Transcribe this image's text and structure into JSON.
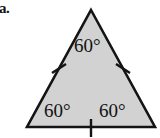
{
  "figure": {
    "item_label": "a.",
    "shape_name": "equilateral-triangle",
    "fill_color": "#d2d2d2",
    "stroke_color": "#141414",
    "background_color": "#ffffff",
    "angles": {
      "top": "60°",
      "bottom_left": "60°",
      "bottom_right": "60°"
    },
    "tick_marks": {
      "count": 3,
      "description": "single tick on each of the three sides"
    }
  }
}
